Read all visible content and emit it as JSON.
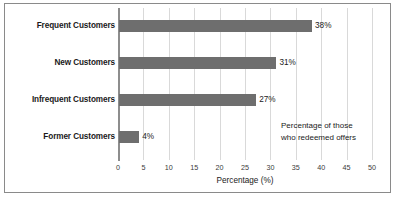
{
  "chart_data": {
    "type": "bar",
    "orientation": "horizontal",
    "title": "",
    "categories": [
      "Frequent Customers",
      "New Customers",
      "Infrequent Customers",
      "Former Customers"
    ],
    "values": [
      38,
      31,
      27,
      4
    ],
    "value_labels": [
      "38%",
      "31%",
      "27%",
      "4%"
    ],
    "xlabel": "Percentage (%)",
    "ylabel": "",
    "xlim": [
      0,
      50
    ],
    "xticks": [
      0,
      5,
      10,
      15,
      20,
      25,
      30,
      35,
      40,
      45,
      50
    ],
    "xtick_labels": [
      "0",
      "5",
      "10",
      "15",
      "20",
      "25",
      "30",
      "35",
      "40",
      "45",
      "50"
    ],
    "grid": "vertical",
    "legend": "none",
    "annotations": [
      {
        "lines": [
          "Percentage of those",
          "who redeemed offers"
        ]
      }
    ],
    "colors": {
      "bar": "#6e6e6e",
      "gridline": "#d9d9d9",
      "axis": "#8d8d8d",
      "border": "#8a8a8a",
      "text": "#1a1a1a",
      "background": "#ffffff"
    }
  }
}
